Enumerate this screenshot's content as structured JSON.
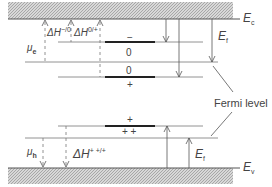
{
  "diagram": {
    "bands": {
      "conduction": {
        "label": "E",
        "sub": "c"
      },
      "valence": {
        "label": "E",
        "sub": "v"
      }
    },
    "left_labels": {
      "mu_e": {
        "label": "μ",
        "sub": "e"
      },
      "mu_h": {
        "label": "μ",
        "sub": "h"
      },
      "dH_minus_zero": {
        "label": "ΔH",
        "sup": "−/0"
      },
      "dH_zero_plus": {
        "label": "ΔH",
        "sup": "0/+"
      },
      "dH_pp_p": {
        "label": "ΔH",
        "sup": "+ +/+"
      }
    },
    "charge_states": {
      "minus": "−",
      "zero_upper": "0",
      "zero_lower": "0",
      "plus_upper": "+",
      "plus_lower": "+",
      "plus_plus": "+ +"
    },
    "fermi_labels": {
      "upper": {
        "label": "E",
        "sub": "f"
      },
      "lower": {
        "label": "E",
        "sub": "f"
      }
    },
    "annotation": "Fermi level",
    "colors": {
      "line": "#555555",
      "thick_level": "#222222",
      "hatch_bg": "#d8d8d8",
      "hatch_fg": "#9a9a9a",
      "text": "#444444"
    }
  }
}
